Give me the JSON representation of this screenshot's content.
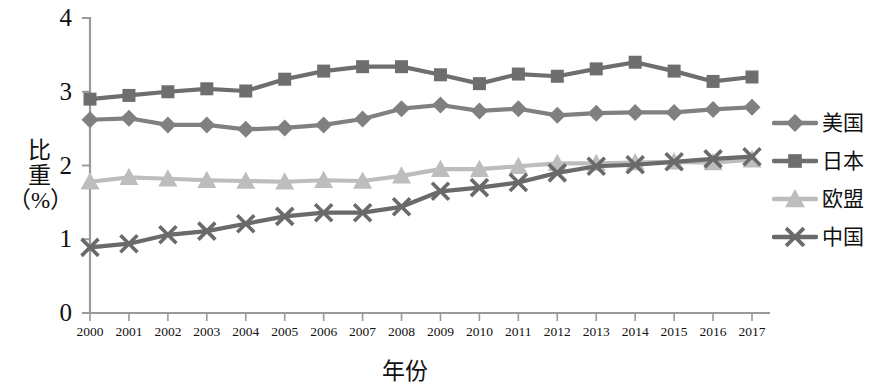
{
  "chart_data": {
    "type": "line",
    "title": "",
    "xlabel": "年份",
    "ylabel": "比重（%）",
    "ylabel_lines": [
      "比",
      "重",
      "（%）"
    ],
    "categories": [
      "2000",
      "2001",
      "2002",
      "2003",
      "2004",
      "2005",
      "2006",
      "2007",
      "2008",
      "2009",
      "2010",
      "2011",
      "2012",
      "2013",
      "2014",
      "2015",
      "2016",
      "2017"
    ],
    "xlim": [
      2000,
      2017
    ],
    "ylim": [
      0,
      4
    ],
    "yticks": [
      0,
      1,
      2,
      3,
      4
    ],
    "ytick_labels": [
      "0",
      "1",
      "2",
      "3",
      "4"
    ],
    "grid": false,
    "legend_position": "right",
    "series": [
      {
        "name": "美国",
        "marker": "diamond",
        "color": "#808080",
        "values": [
          2.62,
          2.64,
          2.55,
          2.55,
          2.49,
          2.51,
          2.55,
          2.63,
          2.77,
          2.82,
          2.74,
          2.77,
          2.68,
          2.71,
          2.72,
          2.72,
          2.76,
          2.79
        ]
      },
      {
        "name": "日本",
        "marker": "square",
        "color": "#6e6e6e",
        "values": [
          2.9,
          2.95,
          3.0,
          3.04,
          3.01,
          3.17,
          3.28,
          3.34,
          3.34,
          3.23,
          3.11,
          3.24,
          3.21,
          3.31,
          3.4,
          3.28,
          3.14,
          3.2
        ]
      },
      {
        "name": "欧盟",
        "marker": "triangle",
        "color": "#bdbdbd",
        "values": [
          1.78,
          1.84,
          1.82,
          1.8,
          1.79,
          1.78,
          1.8,
          1.79,
          1.86,
          1.95,
          1.95,
          1.99,
          2.03,
          2.03,
          2.04,
          2.05,
          2.04,
          2.08
        ]
      },
      {
        "name": "中国",
        "marker": "cross",
        "color": "#6a6a6a",
        "values": [
          0.89,
          0.94,
          1.06,
          1.11,
          1.21,
          1.31,
          1.36,
          1.36,
          1.44,
          1.65,
          1.7,
          1.77,
          1.9,
          1.99,
          2.01,
          2.05,
          2.09,
          2.12
        ]
      }
    ]
  },
  "axes": {
    "y_title_lines": [
      "比",
      "重",
      "（%）"
    ],
    "x_title": "年份"
  },
  "legend": {
    "items": [
      {
        "label": "美国",
        "marker": "diamond",
        "color": "#808080"
      },
      {
        "label": "日本",
        "marker": "square",
        "color": "#6e6e6e"
      },
      {
        "label": "欧盟",
        "marker": "triangle",
        "color": "#bdbdbd"
      },
      {
        "label": "中国",
        "marker": "cross",
        "color": "#6a6a6a"
      }
    ]
  }
}
